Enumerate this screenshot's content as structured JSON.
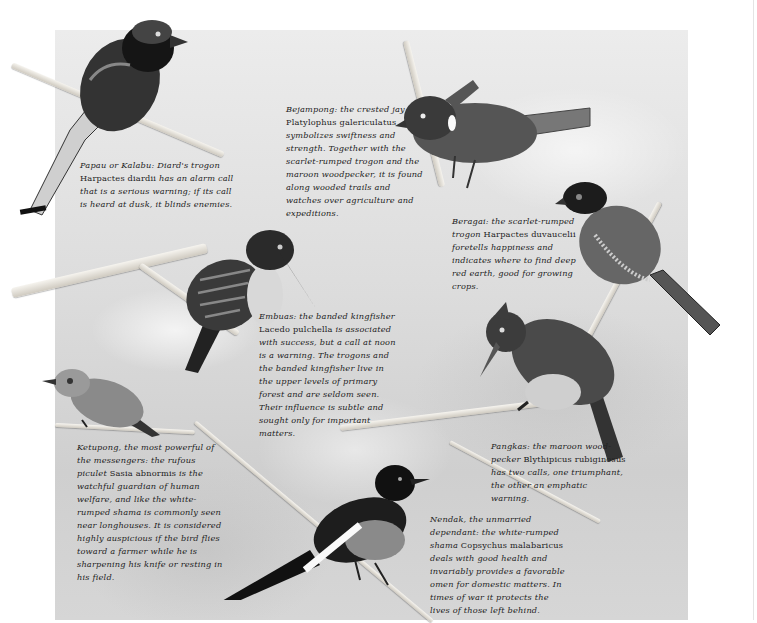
{
  "page": {
    "background_panel_color": "#d9d9d9",
    "ink_color": "#222222"
  },
  "captions": [
    {
      "id": "papau",
      "lead": "Papau or Kalabu: Diard's trogon ",
      "scientific": "Harpactes diardii",
      "rest": " has an alarm call that is a serious warning; if its call is heard at dusk, it blinds enemies."
    },
    {
      "id": "bejampong",
      "lead": "Bejampong: the crested jay ",
      "scientific": "Platylophus galericulatus",
      "rest": " symbolizes swiftness and strength. Together with the scarlet-rumped trogon and the maroon woodpecker, it is found along wooded trails and watches over agriculture and expeditions."
    },
    {
      "id": "beragai",
      "lead": "Beragai: the scarlet-rumped trogon ",
      "scientific": "Harpactes duvaucelii",
      "rest": " foretells happiness and indicates where to find deep red earth, good for growing crops."
    },
    {
      "id": "embuas",
      "lead": "Embuas: the banded kingfisher ",
      "scientific": "Lacedo pulchella",
      "rest": " is associated with success, but a call at noon is a warning. The trogons and the banded kingfisher live in the upper levels of primary forest and are seldom seen. Their influence is subtle and sought only for important matters."
    },
    {
      "id": "pangkas",
      "lead": "Pangkas: the maroon wood-pecker ",
      "scientific": "Blythipicus rubiginosus",
      "rest": " has two calls, one triumphant, the other an emphatic warning."
    },
    {
      "id": "ketupong",
      "lead": "Ketupong, the most powerful of the messengers: the rufous piculet ",
      "scientific": "Sasia abnormis",
      "rest": " is the watchful guardian of human welfare, and like the white-rumped shama is commonly seen near longhouses. It is considered highly auspicious if the bird flies toward a farmer while he is sharpening his knife or resting in his field."
    },
    {
      "id": "nendak",
      "lead": "Nendak, the unmarried dependant: the white-rumped shama ",
      "scientific": "Copsychus malabaricus",
      "rest": " deals with good health and invariably provides a favorable omen for domestic matters. In times of war it protects the lives of those left behind."
    }
  ],
  "birds": [
    {
      "id": "diards-trogon",
      "label": "Diard's trogon"
    },
    {
      "id": "crested-jay",
      "label": "crested jay"
    },
    {
      "id": "scarlet-rumped-trogon",
      "label": "scarlet-rumped trogon"
    },
    {
      "id": "banded-kingfisher",
      "label": "banded kingfisher"
    },
    {
      "id": "maroon-woodpecker",
      "label": "maroon woodpecker"
    },
    {
      "id": "rufous-piculet",
      "label": "rufous piculet"
    },
    {
      "id": "white-rumped-shama",
      "label": "white-rumped shama"
    }
  ]
}
